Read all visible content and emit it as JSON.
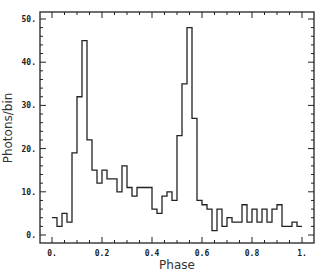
{
  "chart_data": {
    "type": "bar",
    "style": "step-histogram",
    "title": "",
    "xlabel": "Phase",
    "ylabel": "Photons/bin",
    "xlim": [
      0,
      1.0
    ],
    "ylim": [
      0,
      50
    ],
    "x_ticks": [
      0,
      0.2,
      0.4,
      0.6,
      0.8,
      1.0
    ],
    "x_tick_labels": [
      "0.",
      "0.2",
      "0.4",
      "0.6",
      "0.8",
      "1."
    ],
    "y_ticks": [
      0,
      10,
      20,
      30,
      40,
      50
    ],
    "y_tick_labels": [
      "0.",
      "10.",
      "20.",
      "30.",
      "40.",
      "50."
    ],
    "grid": false,
    "legend": null,
    "bin_width": 0.02,
    "bin_starts": [
      0.0,
      0.02,
      0.04,
      0.06,
      0.08,
      0.1,
      0.12,
      0.14,
      0.16,
      0.18,
      0.2,
      0.22,
      0.24,
      0.26,
      0.28,
      0.3,
      0.32,
      0.34,
      0.36,
      0.38,
      0.4,
      0.42,
      0.44,
      0.46,
      0.48,
      0.5,
      0.52,
      0.54,
      0.56,
      0.58,
      0.6,
      0.62,
      0.64,
      0.66,
      0.68,
      0.7,
      0.72,
      0.74,
      0.76,
      0.78,
      0.8,
      0.82,
      0.84,
      0.86,
      0.88,
      0.9,
      0.92,
      0.94,
      0.96,
      0.98
    ],
    "values": [
      4,
      2,
      5,
      3,
      19,
      32,
      45,
      22,
      15,
      12,
      15,
      13,
      13,
      10,
      16,
      11,
      9,
      11,
      11,
      11,
      6,
      5,
      9,
      10,
      8,
      23,
      35,
      48,
      27,
      8,
      7,
      6,
      1,
      6,
      2,
      4,
      3,
      3,
      7,
      3,
      6,
      3,
      6,
      3,
      6,
      7,
      2,
      2,
      3,
      2
    ]
  }
}
